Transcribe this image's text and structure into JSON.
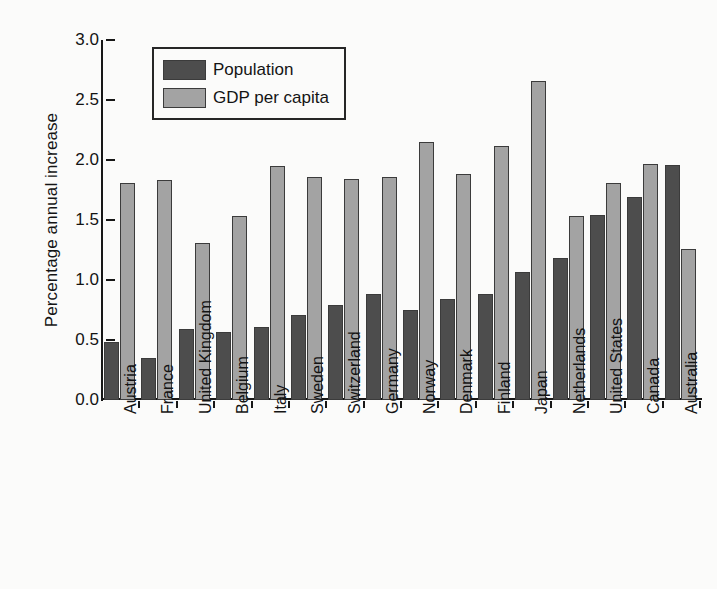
{
  "chart_data": {
    "type": "bar",
    "title": "",
    "subtitle": "",
    "xlabel": "",
    "ylabel": "Percentage annual increase",
    "ylim": [
      0.0,
      3.0
    ],
    "ytick_values": [
      0.0,
      0.5,
      1.0,
      1.5,
      2.0,
      2.5,
      3.0
    ],
    "ytick_labels": [
      "0.0",
      "0.5",
      "1.0",
      "1.5",
      "2.0",
      "2.5",
      "3.0"
    ],
    "grid": false,
    "legend_position": "upper left inside",
    "categories": [
      "Austria",
      "France",
      "United Kingdom",
      "Belgium",
      "Italy",
      "Sweden",
      "Switzerland",
      "Germany",
      "Norway",
      "Denmark",
      "Finland",
      "Japan",
      "Netherlands",
      "United States",
      "Canada",
      "Australia"
    ],
    "series": [
      {
        "name": "Population",
        "color": "#4d4d4d",
        "values": [
          0.48,
          0.35,
          0.59,
          0.57,
          0.61,
          0.71,
          0.79,
          0.88,
          0.75,
          0.84,
          0.88,
          1.07,
          1.18,
          1.54,
          1.69,
          1.96
        ]
      },
      {
        "name": "GDP per capita",
        "color": "#a3a3a3",
        "values": [
          1.81,
          1.83,
          1.31,
          1.53,
          1.95,
          1.86,
          1.84,
          1.86,
          2.15,
          1.88,
          2.12,
          2.66,
          1.53,
          1.81,
          1.97,
          1.26
        ]
      }
    ]
  },
  "legend": {
    "entries": [
      {
        "label": "Population",
        "color": "#4d4d4d"
      },
      {
        "label": "GDP per capita",
        "color": "#a3a3a3"
      }
    ]
  },
  "colors": {
    "population": "#4d4d4d",
    "gdp_per_capita": "#a3a3a3",
    "axis": "#171717",
    "background": "#fbfbfa"
  }
}
